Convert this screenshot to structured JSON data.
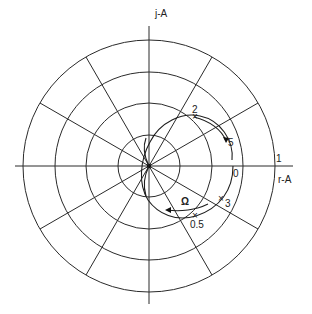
{
  "diagram": {
    "type": "polar-locus",
    "axes": {
      "imag_label": "j-A",
      "real_label": "r-A",
      "unit_label": "1"
    },
    "grid": {
      "circles": 4,
      "radial_step_deg": 30
    },
    "locus": {
      "direction_label": "Ω",
      "points": [
        {
          "label": "0"
        },
        {
          "label": "0.5"
        },
        {
          "label": "2"
        },
        {
          "label": "3"
        },
        {
          "label": "5"
        }
      ]
    }
  }
}
